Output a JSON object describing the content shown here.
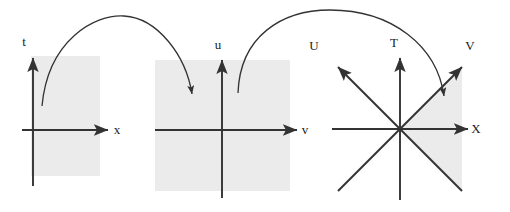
{
  "figure": {
    "title": "",
    "background_color": "#ffffff",
    "shade_color": "#ebebeb",
    "stroke_color": "#333333",
    "label_color": "#1a1a1a"
  },
  "panels": [
    {
      "id": "panel-tx",
      "kind": "axes-2d",
      "origin": [
        33,
        130
      ],
      "shaded_region": {
        "x": 31,
        "y": 56,
        "width": 69,
        "height": 120
      },
      "axes": [
        {
          "name": "vertical-axis",
          "label": "t",
          "label_pos": [
            24,
            46
          ],
          "from": [
            33,
            186
          ],
          "to": [
            33,
            58
          ],
          "arrow": true
        },
        {
          "name": "horizontal-axis",
          "label": "x",
          "label_pos": [
            117,
            134
          ],
          "from": [
            22,
            130
          ],
          "to": [
            108,
            130
          ],
          "arrow": true
        }
      ]
    },
    {
      "id": "panel-uv",
      "kind": "axes-2d",
      "origin": [
        222,
        130
      ],
      "shaded_region": {
        "x": 155,
        "y": 60,
        "width": 135,
        "height": 131
      },
      "axes": [
        {
          "name": "vertical-axis",
          "label": "u",
          "label_pos": [
            218,
            49
          ],
          "from": [
            222,
            198
          ],
          "to": [
            222,
            60
          ],
          "arrow": true
        },
        {
          "name": "horizontal-axis",
          "label": "v",
          "label_pos": [
            305,
            134
          ],
          "from": [
            155,
            130
          ],
          "to": [
            297,
            130
          ],
          "arrow": true
        }
      ]
    },
    {
      "id": "panel-star",
      "kind": "axes-star",
      "origin": [
        400,
        129
      ],
      "shaded_wedge": {
        "description": "wedge between the two diagonal rays on the +X side",
        "right_edge_x": 462
      },
      "rays": [
        {
          "name": "ray-T",
          "label": "T",
          "label_pos": [
            394,
            47
          ],
          "to": [
            400,
            58
          ],
          "arrow": true
        },
        {
          "name": "ray-T-negative",
          "label": "",
          "to": [
            400,
            200
          ],
          "arrow": false
        },
        {
          "name": "ray-X",
          "label": "X",
          "label_pos": [
            476,
            133
          ],
          "to": [
            468,
            129
          ],
          "arrow": true
        },
        {
          "name": "ray-X-negative",
          "label": "",
          "to": [
            332,
            129
          ],
          "arrow": false
        },
        {
          "name": "ray-U",
          "label": "U",
          "label_pos": [
            314,
            50
          ],
          "to": [
            338,
            67
          ],
          "arrow": true
        },
        {
          "name": "ray-U-negative",
          "label": "",
          "to": [
            462,
            191
          ],
          "arrow": false
        },
        {
          "name": "ray-V",
          "label": "V",
          "label_pos": [
            470,
            50
          ],
          "to": [
            462,
            67
          ],
          "arrow": true
        },
        {
          "name": "ray-V-negative",
          "label": "",
          "to": [
            338,
            191
          ],
          "arrow": false
        }
      ]
    }
  ],
  "mapping_arrows": [
    {
      "name": "arrow-tx-to-uv",
      "from": [
        42,
        106
      ],
      "to": [
        193,
        96
      ],
      "path": "M 42 106 C 48 40, 95 14, 124 16 C 158 18, 186 56, 192 94"
    },
    {
      "name": "arrow-uv-to-star",
      "from": [
        238,
        93
      ],
      "to": [
        445,
        99
      ],
      "path": "M 238 93 C 240 36, 282 10, 330 10 C 392 10, 437 46, 444 96"
    }
  ]
}
